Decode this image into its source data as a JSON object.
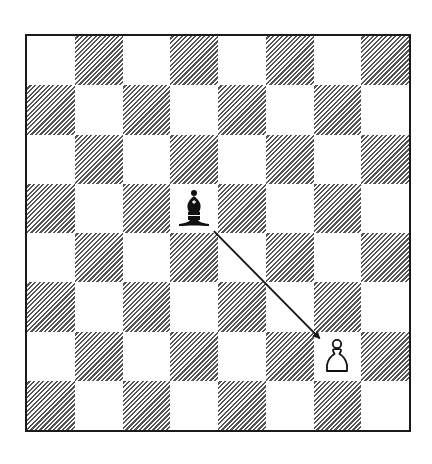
{
  "diagram": {
    "type": "chess-board",
    "files": [
      "a",
      "b",
      "c",
      "d",
      "e",
      "f",
      "g",
      "h"
    ],
    "ranks": [
      8,
      7,
      6,
      5,
      4,
      3,
      2,
      1
    ],
    "light_color": "#ffffff",
    "dark_pattern": "diagonal-hatching",
    "dark_color": "#555555",
    "border_color": "#1a1a1a",
    "pieces": [
      {
        "square": "d5",
        "color": "black",
        "type": "bishop",
        "icon": "black-bishop-icon"
      },
      {
        "square": "g2",
        "color": "white",
        "type": "pawn",
        "icon": "white-pawn-icon"
      }
    ],
    "arrows": [
      {
        "from": "d5",
        "to": "g2",
        "color": "#1a1a1a",
        "label": "bishop-attacks-pawn"
      }
    ]
  }
}
